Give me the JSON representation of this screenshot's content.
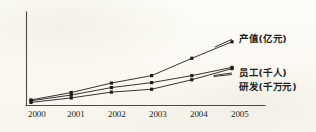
{
  "chart_data": {
    "type": "line",
    "title": "",
    "subtitle": "",
    "xlabel": "",
    "ylabel": "",
    "categories": [
      "2000",
      "2001",
      "2002",
      "2003",
      "2004",
      "2005"
    ],
    "x": [
      2000,
      2001,
      2002,
      2003,
      2004,
      2005
    ],
    "xlim": [
      2000,
      2005
    ],
    "ylim": [
      0,
      10
    ],
    "grid": false,
    "legend_position": "right-inline-labels",
    "axis": {
      "y_axis_visible": true,
      "x_axis_visible": true,
      "y_ticks_visible": false,
      "x_tick_labels": [
        "2000",
        "2001",
        "2002",
        "2003",
        "2004",
        "2005"
      ]
    },
    "series": [
      {
        "name": "产值(亿元)",
        "label": "产值(亿元)",
        "marker": "square",
        "values": [
          0.55,
          1.45,
          2.6,
          3.5,
          5.6,
          7.6
        ]
      },
      {
        "name": "员工(千人)",
        "label": "员工(千人)",
        "marker": "square",
        "values": [
          0.45,
          1.15,
          2.05,
          2.65,
          3.5,
          4.5
        ]
      },
      {
        "name": "研发(千万元)",
        "label": "研发(千万元)",
        "marker": "square",
        "values": [
          0.25,
          0.8,
          1.5,
          1.85,
          3.0,
          4.35
        ]
      }
    ],
    "annotations": [
      {
        "text": "产值(亿元)",
        "anchor_series": "产值(亿元)",
        "anchor_point": "2005"
      },
      {
        "text": "员工(千人)",
        "anchor_series": "员工(千人)",
        "anchor_point": "2005"
      },
      {
        "text": "研发(千万元)",
        "anchor_series": "研发(千万元)",
        "anchor_point": "2005"
      }
    ],
    "colors": {
      "background": "#fcfbf5",
      "axis": "#4a4a46",
      "line": "#2b2b28",
      "marker": "#1d1d1a",
      "text": "#1f1f1c"
    }
  }
}
